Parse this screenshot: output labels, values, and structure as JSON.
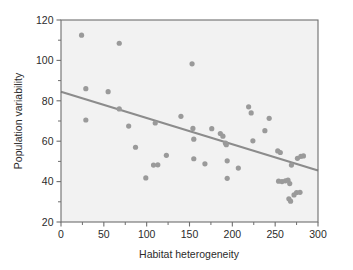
{
  "chart_data": {
    "type": "scatter",
    "title": "",
    "xlabel": "Habitat heterogeneity",
    "ylabel": "Population variability",
    "xlim": [
      0,
      300
    ],
    "ylim": [
      20,
      120
    ],
    "grid": false,
    "legend": null,
    "xticks": [
      0,
      50,
      100,
      150,
      200,
      250,
      300
    ],
    "xtick_labels": [
      "0",
      "50",
      "100",
      "150",
      "200",
      "250",
      "300"
    ],
    "xminorticks": [
      25,
      75,
      125,
      175,
      225,
      275
    ],
    "yticks": [
      20,
      40,
      60,
      80,
      100,
      120
    ],
    "ytick_labels": [
      "20",
      "40",
      "60",
      "80",
      "100",
      "120"
    ],
    "yminorticks": [
      30,
      50,
      70,
      90,
      110
    ],
    "marker_color": "#9a9a9a",
    "marker_size": 5.2,
    "line_color": "#8c8c8c",
    "line_width": 2.2,
    "frame_color": "#6e6e6e",
    "background": "#f2f2f2",
    "points": [
      {
        "x": 24,
        "y": 112.5
      },
      {
        "x": 29,
        "y": 86.0
      },
      {
        "x": 29,
        "y": 70.5
      },
      {
        "x": 55,
        "y": 84.5
      },
      {
        "x": 68,
        "y": 108.5
      },
      {
        "x": 68,
        "y": 76.0
      },
      {
        "x": 79,
        "y": 67.5
      },
      {
        "x": 87,
        "y": 57.0
      },
      {
        "x": 99,
        "y": 41.8
      },
      {
        "x": 108,
        "y": 48.2
      },
      {
        "x": 110,
        "y": 69.0
      },
      {
        "x": 113,
        "y": 48.3
      },
      {
        "x": 123,
        "y": 53.0
      },
      {
        "x": 140,
        "y": 72.3
      },
      {
        "x": 153,
        "y": 98.3
      },
      {
        "x": 154,
        "y": 66.3
      },
      {
        "x": 155,
        "y": 61.0
      },
      {
        "x": 155,
        "y": 51.3
      },
      {
        "x": 168,
        "y": 48.8
      },
      {
        "x": 176,
        "y": 66.2
      },
      {
        "x": 186,
        "y": 63.8
      },
      {
        "x": 189,
        "y": 62.5
      },
      {
        "x": 192,
        "y": 59.0
      },
      {
        "x": 193,
        "y": 58.3
      },
      {
        "x": 194,
        "y": 50.3
      },
      {
        "x": 194,
        "y": 41.6
      },
      {
        "x": 207,
        "y": 46.7
      },
      {
        "x": 219,
        "y": 77.0
      },
      {
        "x": 222,
        "y": 74.0
      },
      {
        "x": 224,
        "y": 60.2
      },
      {
        "x": 238,
        "y": 65.2
      },
      {
        "x": 243,
        "y": 71.3
      },
      {
        "x": 253,
        "y": 55.2
      },
      {
        "x": 256,
        "y": 54.4
      },
      {
        "x": 254,
        "y": 40.2
      },
      {
        "x": 258,
        "y": 40.0
      },
      {
        "x": 262,
        "y": 40.4
      },
      {
        "x": 265,
        "y": 40.7
      },
      {
        "x": 267,
        "y": 39.0
      },
      {
        "x": 266,
        "y": 31.5
      },
      {
        "x": 268,
        "y": 30.3
      },
      {
        "x": 269,
        "y": 48.2
      },
      {
        "x": 272,
        "y": 33.4
      },
      {
        "x": 275,
        "y": 34.6
      },
      {
        "x": 279,
        "y": 34.7
      },
      {
        "x": 276,
        "y": 51.5
      },
      {
        "x": 280,
        "y": 52.5
      },
      {
        "x": 283,
        "y": 52.7
      }
    ],
    "trendline": {
      "x0": 0,
      "y0": 84.5,
      "x1": 300,
      "y1": 45.5
    }
  }
}
